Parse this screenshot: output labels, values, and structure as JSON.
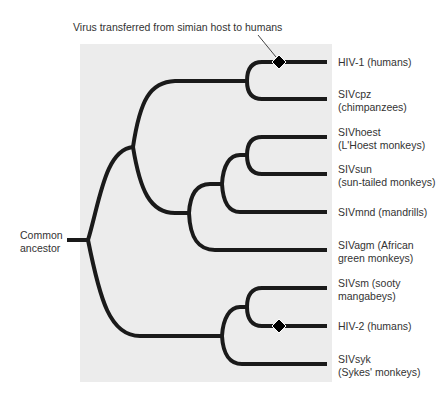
{
  "callout": "Virus transferred from simian host to humans",
  "root_label": [
    "Common",
    "ancestor"
  ],
  "leaves": [
    {
      "line1": "HIV-1 (humans)",
      "line2": "",
      "transfer_marker": true
    },
    {
      "line1": "SIVcpz",
      "line2": "(chimpanzees)",
      "transfer_marker": false
    },
    {
      "line1": "SIVhoest",
      "line2": "(L'Hoest monkeys)",
      "transfer_marker": false
    },
    {
      "line1": "SIVsun",
      "line2": "(sun-tailed monkeys)",
      "transfer_marker": false
    },
    {
      "line1": "SIVmnd (mandrills)",
      "line2": "",
      "transfer_marker": false
    },
    {
      "line1": "SIVagm (African",
      "line2": "green monkeys)",
      "transfer_marker": false
    },
    {
      "line1": "SIVsm (sooty",
      "line2": "mangabeys)",
      "transfer_marker": false
    },
    {
      "line1": "HIV-2 (humans)",
      "line2": "",
      "transfer_marker": true
    },
    {
      "line1": "SIVsyk",
      "line2": "(Sykes' monkeys)",
      "transfer_marker": false
    }
  ],
  "colors": {
    "panel": "#ececec",
    "branch": "#1a1a1a",
    "text": "#333333"
  }
}
